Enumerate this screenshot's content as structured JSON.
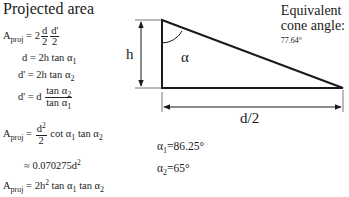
{
  "title": "Projected area",
  "equations": {
    "a_proj_lhs": "A",
    "a_proj_sub": "proj",
    "eq1_rhs_prefix": "= 2",
    "eq1_frac1_num": "d",
    "eq1_frac1_den": "2",
    "eq1_frac2_num": "d'",
    "eq1_frac2_den": "2",
    "eq2": "d = 2h tan α",
    "eq2_sub": "1",
    "eq3": "d' = 2h tan α",
    "eq3_sub": "2",
    "eq4_lhs": "d' = d",
    "eq4_num": "tan α",
    "eq4_num_sub": "2",
    "eq4_den": "tan α",
    "eq4_den_sub": "1",
    "eq5_prefix": "=",
    "eq5_frac_num": "d",
    "eq5_frac_num_sup": "2",
    "eq5_frac_den": "2",
    "eq5_rest_a": "cot α",
    "eq5_rest_a_sub": "1",
    "eq5_rest_b": " tan α",
    "eq5_rest_b_sub": "2",
    "eq6": "≈ 0.070275d",
    "eq6_sup": "2",
    "eq7_rhs": "= 2h",
    "eq7_sup": "2",
    "eq7_a": " tan α",
    "eq7_a_sub": "1",
    "eq7_b": " tan α",
    "eq7_b_sub": "2"
  },
  "diagram": {
    "height_label": "h",
    "angle_label": "α",
    "base_label": "d/2",
    "cone_title_line1": "Equivalent",
    "cone_title_line2": "cone angle:",
    "cone_angle_value": "77.64°",
    "alpha1_symbol": "α",
    "alpha1_sub": "1",
    "alpha1_value": "=86.25°",
    "alpha2_symbol": "α",
    "alpha2_sub": "2",
    "alpha2_value": "=65°"
  },
  "colors": {
    "line": "#1a1a1a",
    "background": "#ffffff"
  }
}
